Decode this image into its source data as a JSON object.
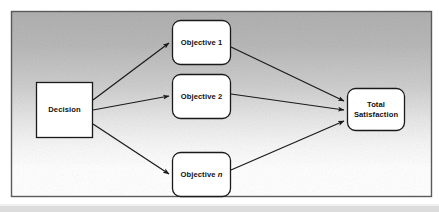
{
  "figure": {
    "type": "flow-diagram",
    "frame": {
      "border_color": "#4a4a4a",
      "background_top_color": "#b4b4b4",
      "background_bottom_color": "#ffffff",
      "x": 11,
      "y": 11,
      "width": 421,
      "height": 186
    },
    "bottom_band_color": "#dcdcdc",
    "node_fill_color": "#ffffff",
    "node_border_color": "#1a1a1a",
    "arrow_color": "#1a1a1a",
    "nodes": [
      {
        "id": "decision",
        "label": "Decision",
        "shape": "rectangle",
        "x": 36,
        "y": 82,
        "width": 57,
        "height": 56,
        "corner_radius": 0
      },
      {
        "id": "objective-1",
        "label": "Objective 1",
        "shape": "rounded-rectangle",
        "x": 172,
        "y": 20,
        "width": 59,
        "height": 45,
        "corner_radius": 8
      },
      {
        "id": "objective-2",
        "label": "Objective 2",
        "shape": "rounded-rectangle",
        "x": 172,
        "y": 74,
        "width": 59,
        "height": 45,
        "corner_radius": 8
      },
      {
        "id": "objective-n",
        "label_prefix": "Objective ",
        "label_italic": "n",
        "label": "Objective n",
        "shape": "rounded-rectangle",
        "x": 172,
        "y": 152,
        "width": 59,
        "height": 45,
        "corner_radius": 8
      },
      {
        "id": "total-satisfaction",
        "label_line1": "Total",
        "label_line2": "Satisfaction",
        "label": "Total Satisfaction",
        "shape": "rounded-rectangle",
        "x": 347,
        "y": 88,
        "width": 58,
        "height": 43,
        "corner_radius": 8
      }
    ],
    "edges": [
      {
        "id": "decision-to-objective-1",
        "from": "decision",
        "to": "objective-1",
        "arrowhead": true
      },
      {
        "id": "decision-to-objective-2",
        "from": "decision",
        "to": "objective-2",
        "arrowhead": true
      },
      {
        "id": "decision-to-objective-n",
        "from": "decision",
        "to": "objective-n",
        "arrowhead": true
      },
      {
        "id": "objective-1-to-total",
        "from": "objective-1",
        "to": "total-satisfaction",
        "arrowhead": true
      },
      {
        "id": "objective-2-to-total",
        "from": "objective-2",
        "to": "total-satisfaction",
        "arrowhead": true
      },
      {
        "id": "objective-n-to-total",
        "from": "objective-n",
        "to": "total-satisfaction",
        "arrowhead": true
      }
    ]
  }
}
